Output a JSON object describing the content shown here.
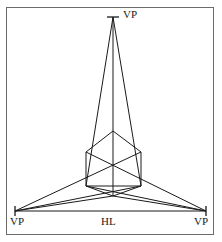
{
  "figure": {
    "type": "perspective-diagram",
    "background_color": "#ffffff",
    "line_color": "#1a1a1a",
    "frame_color": "#6b6b6b",
    "labels": {
      "vp_top": "VP",
      "vp_left": "VP",
      "vp_right": "VP",
      "horizon_line": "HL"
    },
    "points": {
      "vp_top": {
        "x": 113,
        "y": 17
      },
      "vp_left": {
        "x": 15,
        "y": 211
      },
      "vp_right": {
        "x": 206,
        "y": 211
      },
      "cube_top_front": {
        "x": 113,
        "y": 131
      },
      "cube_top_left": {
        "x": 86,
        "y": 152
      },
      "cube_top_right": {
        "x": 141,
        "y": 152
      },
      "cube_bottom_front": {
        "x": 113,
        "y": 196
      },
      "cube_bottom_left": {
        "x": 86,
        "y": 186
      },
      "cube_bottom_right": {
        "x": 141,
        "y": 186
      },
      "cube_vertical_center_bottom": {
        "x": 113,
        "y": 186
      }
    },
    "horizon_line": {
      "x1": 15,
      "y1": 211,
      "x2": 206,
      "y2": 211
    },
    "vertical_axis": {
      "x1": 113,
      "y1": 17,
      "x2": 113,
      "y2": 196
    },
    "tick_marks": [
      {
        "name": "vp-top-tick",
        "x": 113,
        "y": 17,
        "half_width": 6
      },
      {
        "name": "vp-left-tick",
        "x": 15,
        "y": 211,
        "half_height": 5
      },
      {
        "name": "vp-right-tick",
        "x": 206,
        "y": 211,
        "half_height": 5
      }
    ]
  }
}
